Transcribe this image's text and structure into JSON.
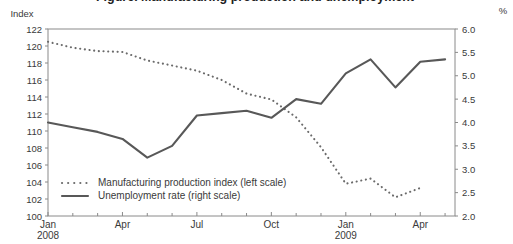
{
  "title_clipped": "Figure. Manufacturing production and unemployment",
  "chart_data": {
    "type": "line",
    "grid": false,
    "legend_position": "inside-bottom-left",
    "months": [
      "2008-01",
      "2008-02",
      "2008-03",
      "2008-04",
      "2008-05",
      "2008-06",
      "2008-07",
      "2008-08",
      "2008-09",
      "2008-10",
      "2008-11",
      "2008-12",
      "2009-01",
      "2009-02",
      "2009-03",
      "2009-04",
      "2009-05"
    ],
    "left_axis": {
      "label": "Index",
      "min": 100,
      "max": 122,
      "step": 2,
      "tick_labels": [
        "122",
        "120",
        "118",
        "116",
        "114",
        "112",
        "110",
        "108",
        "106",
        "104",
        "102",
        "100"
      ]
    },
    "right_axis": {
      "label": "%",
      "min": 2.0,
      "max": 6.0,
      "step": 0.5,
      "tick_labels": [
        "6.0",
        "5.5",
        "5.0",
        "4.5",
        "4.0",
        "3.5",
        "3.0",
        "2.5",
        "2.0"
      ]
    },
    "x_ticks": [
      {
        "month_index": 0,
        "label": "Jan",
        "year": "2008"
      },
      {
        "month_index": 3,
        "label": "Apr"
      },
      {
        "month_index": 6,
        "label": "Jul"
      },
      {
        "month_index": 9,
        "label": "Oct"
      },
      {
        "month_index": 12,
        "label": "Jan",
        "year": "2009"
      },
      {
        "month_index": 15,
        "label": "Apr"
      }
    ],
    "series": [
      {
        "name": "Manufacturing production index (left scale)",
        "axis": "left",
        "style": "dotted",
        "color": "#6b6b6b",
        "values": [
          120.5,
          119.8,
          119.4,
          119.3,
          118.3,
          117.7,
          117.1,
          116.0,
          114.4,
          113.7,
          111.6,
          108.1,
          103.8,
          104.4,
          102.2,
          103.3
        ]
      },
      {
        "name": "Unemployment rate (right scale)",
        "axis": "right",
        "style": "solid",
        "color": "#585858",
        "values": [
          4.0,
          3.9,
          3.8,
          3.65,
          3.25,
          3.5,
          4.15,
          4.2,
          4.25,
          4.1,
          4.5,
          4.4,
          5.05,
          5.35,
          4.75,
          5.3,
          5.35
        ]
      }
    ],
    "colors": {
      "axis": "#8a8a8a",
      "tick_text": "#3a3a3a"
    }
  }
}
